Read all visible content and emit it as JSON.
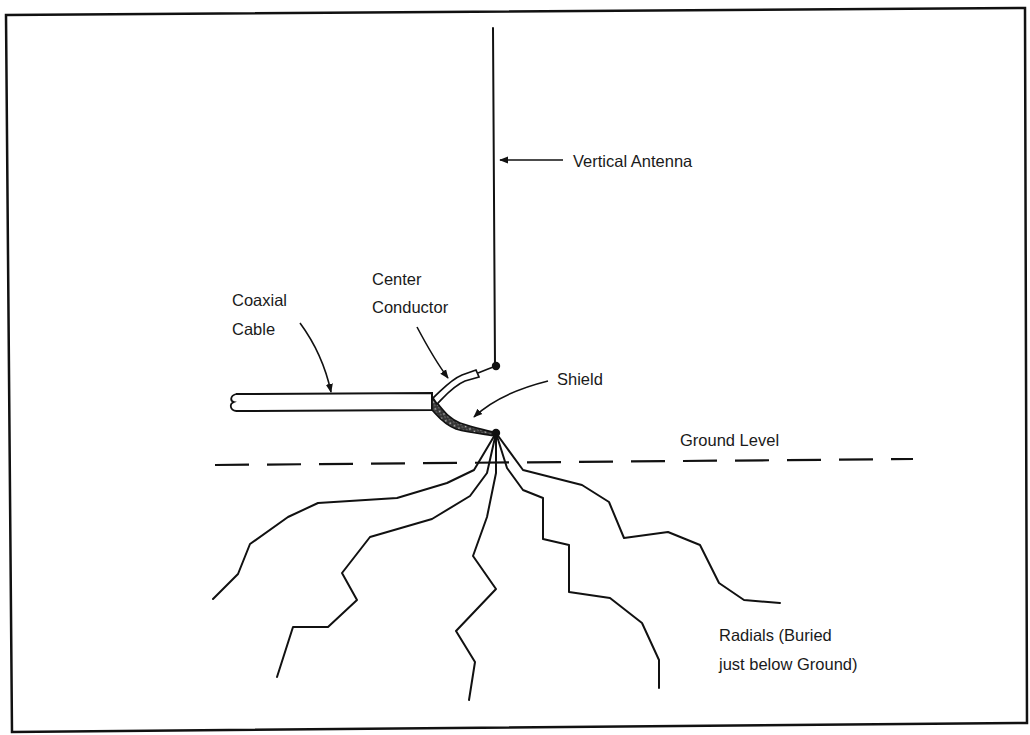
{
  "diagram": {
    "type": "antenna-grounding-diagram",
    "labels": {
      "vertical_antenna": "Vertical Antenna",
      "coaxial_line1": "Coaxial",
      "coaxial_line2": "Cable",
      "center_line1": "Center",
      "center_line2": "Conductor",
      "shield": "Shield",
      "ground_level": "Ground Level",
      "radials_line1": "Radials (Buried",
      "radials_line2": "just below Ground)"
    },
    "components": [
      {
        "id": "vertical-antenna",
        "label": "Vertical Antenna"
      },
      {
        "id": "coaxial-cable",
        "label": "Coaxial Cable"
      },
      {
        "id": "center-conductor",
        "label": "Center Conductor"
      },
      {
        "id": "shield",
        "label": "Shield"
      },
      {
        "id": "ground-level",
        "label": "Ground Level"
      },
      {
        "id": "radials",
        "label": "Radials (Buried just below Ground)",
        "count": 5
      }
    ],
    "colors": {
      "line": "#111111",
      "background": "#ffffff",
      "text": "#1a1a1a"
    }
  }
}
